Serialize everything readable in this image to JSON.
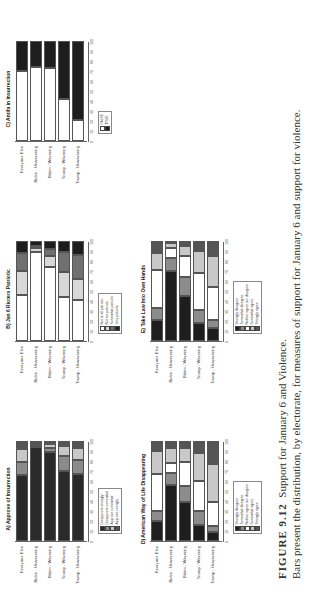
{
  "caption": {
    "figure_label": "FIGURE 9.12",
    "title": "Support for January 6 and Violence.",
    "text": "Bars present the distribution, by electorate, for measures of support for January 6 and support for violence."
  },
  "chart_data": [
    {
      "type": "bar",
      "orientation": "horizontal-stacked",
      "title": "A) Approve of Insurrection",
      "categories": [
        "Everyone Else",
        "Biden - Unwavering",
        "Biden - Wavering",
        "Trump - Wavering",
        "Trump - Unwavering"
      ],
      "xlim": [
        0,
        100
      ],
      "ticks": [
        "0",
        "10",
        "20",
        "30",
        "40",
        "50",
        "60",
        "70",
        "80",
        "90",
        "100"
      ],
      "series": [
        {
          "name": "Disapprove strongly",
          "color": "#2a2a2a",
          "values": [
            66,
            100,
            89,
            70,
            67
          ]
        },
        {
          "name": "Disapprove somewhat",
          "color": "#8c8c8c",
          "values": [
            13,
            0,
            4,
            15,
            14
          ]
        },
        {
          "name": "Approve somewhat",
          "color": "#c8c8c8",
          "values": [
            13,
            0,
            4,
            10,
            12
          ]
        },
        {
          "name": "Approve strongly",
          "color": "#555555",
          "values": [
            8,
            0,
            3,
            5,
            7
          ]
        }
      ]
    },
    {
      "type": "bar",
      "orientation": "horizontal-stacked",
      "title": "B) Jan 6 Rioters Patriotic",
      "categories": [
        "Everyone Else",
        "Biden - Unwavering",
        "Biden - Wavering",
        "Trump - Wavering",
        "Trump - Unwavering"
      ],
      "xlim": [
        0,
        100
      ],
      "ticks": [
        "0",
        "10",
        "20",
        "30",
        "40",
        "50",
        "60",
        "70",
        "80",
        "90",
        "100"
      ],
      "series": [
        {
          "name": "Not at all patriotic",
          "color": "#ffffff",
          "values": [
            46,
            89,
            74,
            44,
            41
          ]
        },
        {
          "name": "Not too patriotic",
          "color": "#d8d8d8",
          "values": [
            24,
            4,
            11,
            25,
            21
          ]
        },
        {
          "name": "Somewhat patriotic",
          "color": "#707070",
          "values": [
            18,
            2,
            7,
            20,
            24
          ]
        },
        {
          "name": "Very patriotic",
          "color": "#1e1e1e",
          "values": [
            12,
            5,
            8,
            11,
            14
          ]
        }
      ]
    },
    {
      "type": "bar",
      "orientation": "horizontal-stacked",
      "title": "C) Antifa in Insurrection",
      "categories": [
        "Everyone Else",
        "Biden - Unwavering",
        "Biden - Wavering",
        "Trump - Wavering",
        "Trump - Unwavering"
      ],
      "xlim": [
        0,
        100
      ],
      "ticks": [
        "0",
        "10",
        "20",
        "30",
        "40",
        "50",
        "60",
        "70",
        "80",
        "90",
        "100"
      ],
      "series": [
        {
          "name": "FALSE",
          "color": "#ffffff",
          "values": [
            70,
            74,
            73,
            42,
            21
          ]
        },
        {
          "name": "TRUE",
          "color": "#1e1e1e",
          "values": [
            30,
            26,
            27,
            58,
            79
          ]
        }
      ]
    },
    {
      "type": "bar",
      "orientation": "horizontal-stacked",
      "title": "D) American Way of Life Disappearing",
      "categories": [
        "Everyone Else",
        "Biden - Unwavering",
        "Biden - Wavering",
        "Trump - Wavering",
        "Trump - Unwavering"
      ],
      "xlim": [
        0,
        100
      ],
      "ticks": [
        "0",
        "10",
        "20",
        "30",
        "40",
        "50",
        "60",
        "70",
        "80",
        "90",
        "100"
      ],
      "series": [
        {
          "name": "Strongly disagree",
          "color": "#1e1e1e",
          "values": [
            20,
            56,
            39,
            16,
            9
          ]
        },
        {
          "name": "Somewhat disagree",
          "color": "#8c8c8c",
          "values": [
            10,
            12,
            16,
            14,
            6
          ]
        },
        {
          "name": "Neither agree nor disagree",
          "color": "#ffffff",
          "values": [
            37,
            10,
            24,
            30,
            24
          ]
        },
        {
          "name": "Somewhat agree",
          "color": "#c8c8c8",
          "values": [
            23,
            15,
            14,
            28,
            38
          ]
        },
        {
          "name": "Strongly agree",
          "color": "#555555",
          "values": [
            10,
            7,
            7,
            12,
            23
          ]
        }
      ]
    },
    {
      "type": "bar",
      "orientation": "horizontal-stacked",
      "title": "E) Take Law Into Own Hands",
      "categories": [
        "Everyone Else",
        "Biden - Unwavering",
        "Biden - Wavering",
        "Trump - Wavering",
        "Trump - Unwavering"
      ],
      "xlim": [
        0,
        100
      ],
      "ticks": [
        "0",
        "10",
        "20",
        "30",
        "40",
        "50",
        "60",
        "70",
        "80",
        "90",
        "100"
      ],
      "series": [
        {
          "name": "Strongly disagree",
          "color": "#1e1e1e",
          "values": [
            21,
            70,
            45,
            18,
            13
          ]
        },
        {
          "name": "Somewhat disagree",
          "color": "#8c8c8c",
          "values": [
            12,
            13,
            19,
            13,
            8
          ]
        },
        {
          "name": "Neither agree nor disagree",
          "color": "#ffffff",
          "values": [
            38,
            10,
            21,
            37,
            33
          ]
        },
        {
          "name": "Somewhat agree",
          "color": "#c8c8c8",
          "values": [
            17,
            5,
            10,
            22,
            31
          ]
        },
        {
          "name": "Strongly agree",
          "color": "#555555",
          "values": [
            12,
            2,
            5,
            10,
            15
          ]
        }
      ]
    }
  ]
}
